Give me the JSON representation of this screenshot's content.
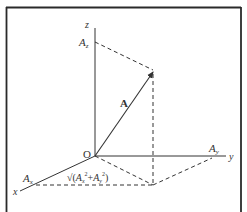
{
  "diagram": {
    "colors": {
      "line": "#333333",
      "frame": "#2a2a2a",
      "background": "#ffffff"
    },
    "axes": {
      "x_label": "x",
      "y_label": "y",
      "z_label": "z",
      "origin_label": "O"
    },
    "vector": {
      "label": "A"
    },
    "components": {
      "ax": {
        "base": "A",
        "sub": "x"
      },
      "ay": {
        "base": "A",
        "sub": "y"
      },
      "az": {
        "base": "A",
        "sub": "z"
      }
    },
    "projection_label": {
      "root": "√(",
      "term1_base": "A",
      "term1_sub": "x",
      "sup1": "2",
      "plus": "+",
      "term2_base": "A",
      "term2_sub": "y",
      "sup2": "2",
      "close": ")"
    }
  }
}
